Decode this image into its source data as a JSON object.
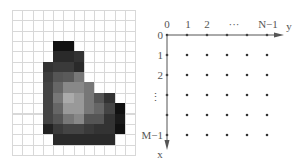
{
  "left_panel": {
    "name": "pixel-image-grid",
    "cols": 12,
    "rows": 14,
    "cell_w": 10.25,
    "cell_h": 10.35,
    "grid_line_color": "#d8d8d8",
    "background": "#ffffff",
    "filled_cells": [
      {
        "r": 3,
        "c": 4,
        "v": "#121212"
      },
      {
        "r": 3,
        "c": 5,
        "v": "#121212"
      },
      {
        "r": 4,
        "c": 4,
        "v": "#2a2a2a"
      },
      {
        "r": 4,
        "c": 5,
        "v": "#2a2a2a"
      },
      {
        "r": 4,
        "c": 6,
        "v": "#333333"
      },
      {
        "r": 5,
        "c": 3,
        "v": "#333333"
      },
      {
        "r": 5,
        "c": 4,
        "v": "#3a3a3a"
      },
      {
        "r": 5,
        "c": 5,
        "v": "#3a3a3a"
      },
      {
        "r": 5,
        "c": 6,
        "v": "#2a2a2a"
      },
      {
        "r": 6,
        "c": 3,
        "v": "#3e3e3e"
      },
      {
        "r": 6,
        "c": 4,
        "v": "#555555"
      },
      {
        "r": 6,
        "c": 5,
        "v": "#5a5a5a"
      },
      {
        "r": 6,
        "c": 6,
        "v": "#777777"
      },
      {
        "r": 7,
        "c": 3,
        "v": "#444444"
      },
      {
        "r": 7,
        "c": 4,
        "v": "#666666"
      },
      {
        "r": 7,
        "c": 5,
        "v": "#888888"
      },
      {
        "r": 7,
        "c": 6,
        "v": "#888888"
      },
      {
        "r": 7,
        "c": 7,
        "v": "#777777"
      },
      {
        "r": 8,
        "c": 3,
        "v": "#444444"
      },
      {
        "r": 8,
        "c": 4,
        "v": "#777777"
      },
      {
        "r": 8,
        "c": 5,
        "v": "#aaaaaa"
      },
      {
        "r": 8,
        "c": 6,
        "v": "#999999"
      },
      {
        "r": 8,
        "c": 7,
        "v": "#777777"
      },
      {
        "r": 8,
        "c": 8,
        "v": "#555555"
      },
      {
        "r": 8,
        "c": 9,
        "v": "#333333"
      },
      {
        "r": 9,
        "c": 3,
        "v": "#444444"
      },
      {
        "r": 9,
        "c": 4,
        "v": "#666666"
      },
      {
        "r": 9,
        "c": 5,
        "v": "#999999"
      },
      {
        "r": 9,
        "c": 6,
        "v": "#999999"
      },
      {
        "r": 9,
        "c": 7,
        "v": "#777777"
      },
      {
        "r": 9,
        "c": 8,
        "v": "#666666"
      },
      {
        "r": 9,
        "c": 9,
        "v": "#444444"
      },
      {
        "r": 9,
        "c": 10,
        "v": "#111111"
      },
      {
        "r": 10,
        "c": 3,
        "v": "#444444"
      },
      {
        "r": 10,
        "c": 4,
        "v": "#555555"
      },
      {
        "r": 10,
        "c": 5,
        "v": "#777777"
      },
      {
        "r": 10,
        "c": 6,
        "v": "#888888"
      },
      {
        "r": 10,
        "c": 7,
        "v": "#555555"
      },
      {
        "r": 10,
        "c": 8,
        "v": "#555555"
      },
      {
        "r": 10,
        "c": 9,
        "v": "#333333"
      },
      {
        "r": 10,
        "c": 10,
        "v": "#1a1a1a"
      },
      {
        "r": 11,
        "c": 3,
        "v": "#222222"
      },
      {
        "r": 11,
        "c": 4,
        "v": "#3a3a3a"
      },
      {
        "r": 11,
        "c": 5,
        "v": "#444444"
      },
      {
        "r": 11,
        "c": 6,
        "v": "#444444"
      },
      {
        "r": 11,
        "c": 7,
        "v": "#3a3a3a"
      },
      {
        "r": 11,
        "c": 8,
        "v": "#333333"
      },
      {
        "r": 11,
        "c": 9,
        "v": "#333333"
      },
      {
        "r": 11,
        "c": 10,
        "v": "#111111"
      },
      {
        "r": 12,
        "c": 4,
        "v": "#2a2a2a"
      },
      {
        "r": 12,
        "c": 5,
        "v": "#2a2a2a"
      },
      {
        "r": 12,
        "c": 6,
        "v": "#2a2a2a"
      },
      {
        "r": 12,
        "c": 7,
        "v": "#2a2a2a"
      },
      {
        "r": 12,
        "c": 8,
        "v": "#2a2a2a"
      },
      {
        "r": 12,
        "c": 9,
        "v": "#2a2a2a"
      }
    ]
  },
  "right_panel": {
    "name": "coordinate-convention-diagram",
    "origin": {
      "x": 167,
      "y": 35
    },
    "spacing": 20,
    "dot_cols": 6,
    "dot_rows": 6,
    "axis_color": "#555555",
    "y_axis_label": "y",
    "x_axis_label": "x",
    "column_labels": [
      "0",
      "1",
      "2",
      "···",
      "N−1"
    ],
    "row_labels": [
      "0",
      "1",
      "2",
      "⋮",
      "M−1"
    ]
  }
}
